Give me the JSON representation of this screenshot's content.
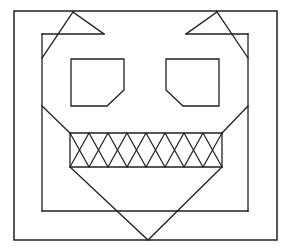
{
  "canvas": {
    "width": 289,
    "height": 249,
    "background_color": "#ffffff",
    "stroke_color": "#231f20",
    "title": "Stylized jack-o-lantern face line drawing"
  },
  "drawing": {
    "type": "line-art",
    "subject": "stylized monster / jack-o-lantern face",
    "outer_border": {
      "name": "outer-border",
      "shape": "rectangle",
      "points": "14,11 277,11 277,240 14,240 14,11"
    },
    "inner_frame": {
      "name": "inner-frame-head",
      "shape": "polyline-with-ear-notches",
      "description": "Head outline: left vertical edge, top edge broken by two triangular ear notches, right vertical edge, bottom edge",
      "left_edge": "42,34 42,211",
      "bottom_edge": "42,211 248,211",
      "right_edge": "248,211 248,34",
      "top_left_segment": "42,34 104,34",
      "top_right_segment": "186,34 248,34"
    },
    "ears": {
      "name": "ear-notches",
      "left_ear": "42,34 104,34 73,12 104,34",
      "left_ear_paths": [
        "73,12 104,34",
        "42,34 104,34",
        "42,58 73,12"
      ],
      "right_ear_paths": [
        "217,12 186,34",
        "248,34 186,34",
        "248,58 217,12"
      ]
    },
    "cheeks": {
      "name": "cheek-diagonals",
      "left_cheek": "42,106 70,133",
      "right_cheek": "248,106 222,133"
    },
    "eyes": [
      {
        "name": "left-eye",
        "shape": "pentagon-cut-bottom-right",
        "points": "71,59 124,59 124,90 107,106 71,106 71,59"
      },
      {
        "name": "right-eye",
        "shape": "pentagon-cut-bottom-left",
        "points": "219,59 166,59 166,90 183,106 219,106 219,59"
      }
    ],
    "mouth": {
      "name": "mouth",
      "shape": "rectangle",
      "points": "70,133 222,133 222,167 70,167 70,133",
      "top_y": 133,
      "bottom_y": 167,
      "left_x": 70,
      "right_x": 222,
      "teeth": {
        "name": "teeth-zigzag",
        "description": "Two interleaved zigzag polylines forming diamond and X shapes across the mouth",
        "segment_count": 8,
        "zigzag_a": "70,133 89,167 108,133 127,167 146,133 165,167 184,133 203,167 222,133",
        "zigzag_b": "70,167 89,133 108,167 127,133 146,167 165,133 184,167 203,133 222,167"
      }
    },
    "chin": {
      "name": "chin-v-shape",
      "shape": "v",
      "points": "70,167 148,240 222,167",
      "apex_x": 148,
      "apex_y": 240
    }
  }
}
